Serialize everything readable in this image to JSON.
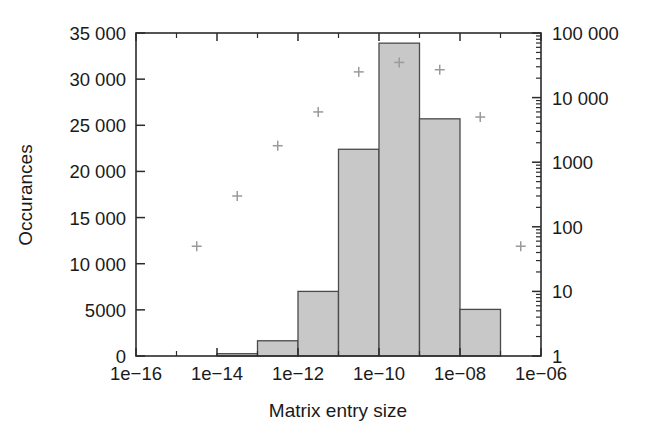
{
  "chart_data": {
    "type": "bar",
    "title": "",
    "subtitle": "",
    "xlabel": "Matrix entry size",
    "ylabel": "Occurances",
    "ylabel_right": "",
    "xscale": "log",
    "yscale": "linear",
    "yscale_right": "log",
    "xlim": [
      1e-16,
      1e-06
    ],
    "ylim": [
      0,
      35000
    ],
    "ylim_right": [
      1,
      100000
    ],
    "grid": false,
    "legend": "none",
    "xtick_labels": [
      "1e−16",
      "1e−14",
      "1e−12",
      "1e−10",
      "1e−08",
      "1e−06"
    ],
    "xtick_values": [
      1e-16,
      1e-14,
      1e-12,
      1e-10,
      1e-08,
      1e-06
    ],
    "ytick_labels": [
      "0",
      "5000",
      "10 000",
      "15 000",
      "20 000",
      "25 000",
      "30 000",
      "35 000"
    ],
    "ytick_values": [
      0,
      5000,
      10000,
      15000,
      20000,
      25000,
      30000,
      35000
    ],
    "ytick_right_labels": [
      "1",
      "10",
      "100",
      "1000",
      "10 000",
      "100 000"
    ],
    "ytick_right_values": [
      1,
      10,
      100,
      1000,
      10000,
      100000
    ],
    "bin_edges": [
      1e-16,
      1e-15,
      1e-14,
      1e-13,
      1e-12,
      1e-11,
      1e-10,
      1e-09,
      1e-08,
      1e-07,
      1e-06
    ],
    "bin_centers": [
      3.16e-16,
      3.16e-15,
      3.16e-14,
      3.16e-13,
      3.16e-12,
      3.16e-11,
      3.16e-10,
      3.16e-09,
      3.16e-08,
      3.16e-07
    ],
    "series": [
      {
        "name": "Occurances (histogram)",
        "axis": "left",
        "render": "bar",
        "values": [
          0,
          0,
          250,
          1650,
          7000,
          22400,
          33900,
          25700,
          5050,
          0
        ]
      },
      {
        "name": "Cumulative occurances (log)",
        "axis": "right",
        "render": "scatter",
        "marker": "plus",
        "x": [
          3.16e-15,
          3.16e-14,
          3.16e-13,
          3.16e-12,
          3.16e-11,
          3.16e-10,
          3.16e-09,
          3.16e-08,
          3.16e-07
        ],
        "values": [
          50,
          300,
          1800,
          6000,
          25000,
          35000,
          27000,
          5000,
          50
        ]
      }
    ],
    "colors": {
      "bar_fill": "#c8c8c8",
      "bar_stroke": "#4a4a4a",
      "marker": "#9a9a9a",
      "axis": "#2b2b2b",
      "text": "#1a1a1a",
      "background": "#ffffff"
    }
  }
}
